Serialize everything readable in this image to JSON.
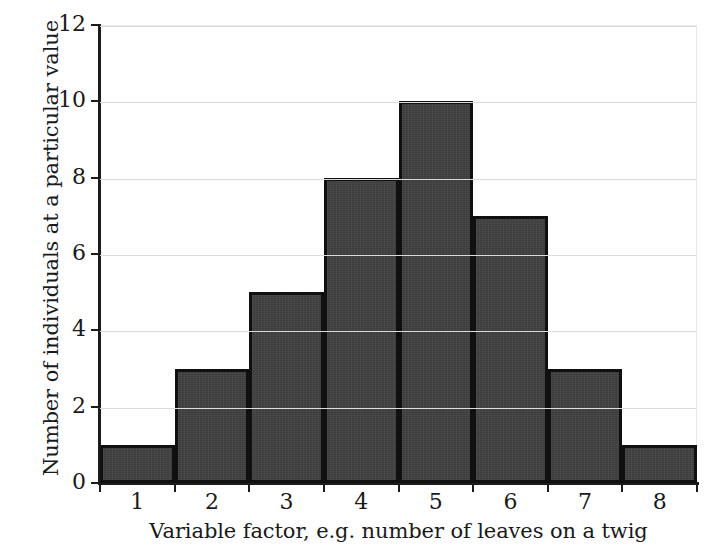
{
  "chart_data": {
    "type": "bar",
    "title": "",
    "subtitle": "",
    "xlabel": "Variable factor, e.g. number of leaves on a twig",
    "ylabel": "Number of individuals at a particular value",
    "categories": [
      "1",
      "2",
      "3",
      "4",
      "5",
      "6",
      "7",
      "8"
    ],
    "values": [
      1,
      3,
      5,
      8,
      10,
      7,
      3,
      1
    ],
    "series": [
      {
        "name": "Number of individuals",
        "values": [
          1,
          3,
          5,
          8,
          10,
          7,
          3,
          1
        ]
      }
    ],
    "xlim": [
      0.5,
      8.5
    ],
    "ylim": [
      0,
      12
    ],
    "ytick_labels": [
      "0",
      "2",
      "4",
      "6",
      "8",
      "10",
      "12"
    ],
    "ytick_values": [
      0,
      2,
      4,
      6,
      8,
      10,
      12
    ],
    "xtick_labels": [
      "1",
      "2",
      "3",
      "4",
      "5",
      "6",
      "7",
      "8"
    ],
    "xtick_boundaries": [
      0.5,
      1.5,
      2.5,
      3.5,
      4.5,
      5.5,
      6.5,
      7.5,
      8.5
    ],
    "grid": "horizontal",
    "legend": "none",
    "bar_gap": 0,
    "colors": {
      "bar_fill": "#3f3f3f",
      "bar_edge": "#101010",
      "gridline": "#dcdcdc",
      "gridline_over_bar": "#c9c9c9",
      "axis": "#1c1c1c",
      "background": "#ffffff",
      "text": "#1a1a1a"
    }
  }
}
